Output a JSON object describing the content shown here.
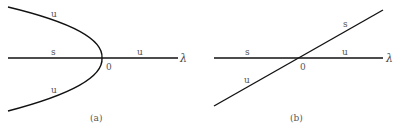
{
  "panel_a": {
    "caption": "(a)",
    "axis_label": "λ",
    "origin_label": "0",
    "labels": {
      "upper_branch": "u",
      "left_axis": "s",
      "right_axis": "u",
      "lower_branch": "u"
    }
  },
  "panel_b": {
    "caption": "(b)",
    "axis_label": "λ",
    "origin_label": "0",
    "labels": {
      "upper_diagonal": "s",
      "left_axis": "s",
      "right_axis": "u",
      "lower_diagonal": "u"
    }
  },
  "colors": {
    "line": "#111111",
    "text": "#555555",
    "background": "#ffffff"
  }
}
